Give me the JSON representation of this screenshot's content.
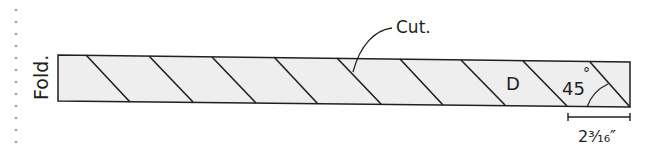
{
  "diagram": {
    "fold_label": "Fold.",
    "cut_label": "Cut.",
    "piece_label": "D",
    "angle_label": "45",
    "angle_unit": "°",
    "measurement_label": "2³⁄₁₆″",
    "colors": {
      "stroke": "#231f20",
      "fill": "#eeeeee",
      "dots": "#999999"
    }
  }
}
